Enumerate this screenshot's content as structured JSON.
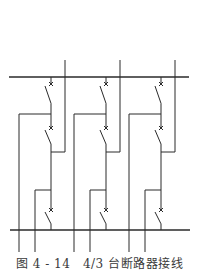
{
  "figure": {
    "caption": "图 4 - 14　4/3 台断路器接线",
    "colors": {
      "line": "#2a2a2a",
      "background": "#ffffff",
      "caption": "#3a3a3a"
    }
  },
  "diagram": {
    "type": "4/3 breaker scheme single-line diagram",
    "top_bus": {
      "label": "",
      "y": 77,
      "x1": 9,
      "x2": 189
    },
    "bottom_bus": {
      "label": "",
      "y": 230,
      "x1": 10,
      "x2": 190
    },
    "bay_count": 3,
    "bays": [
      {
        "id": "bay-1",
        "breaker_x": 51,
        "breakers": 3
      },
      {
        "id": "bay-2",
        "breaker_x": 106,
        "breakers": 3
      },
      {
        "id": "bay-3",
        "breaker_x": 161,
        "breakers": 3
      }
    ],
    "breaker_symbol": "x-marked disconnect switch",
    "feeders_per_bay": 3
  }
}
